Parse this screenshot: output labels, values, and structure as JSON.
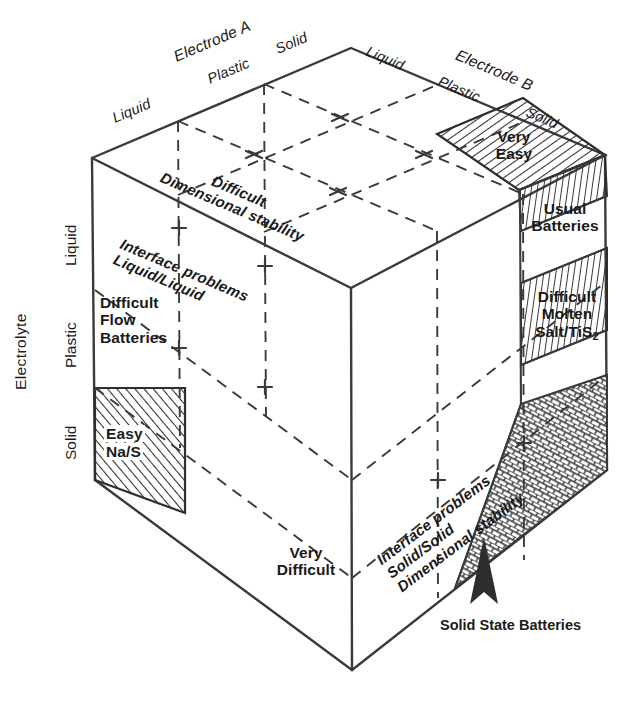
{
  "figure": {
    "type": "isometric-cube-diagram",
    "stroke_color": "#3a3a3a",
    "text_color": "#1a1a1a",
    "background": "#ffffff"
  },
  "axes": {
    "electrode_a": {
      "name": "Electrode A",
      "ticks": [
        "Liquid",
        "Plastic",
        "Solid"
      ]
    },
    "electrode_b": {
      "name": "Electrode B",
      "ticks": [
        "Liquid",
        "Plastic",
        "Solid"
      ]
    },
    "electrolyte": {
      "name": "Electrolyte",
      "ticks": [
        "Liquid",
        "Plastic",
        "Solid"
      ]
    }
  },
  "faces": {
    "top": {
      "label_line1": "Difficult",
      "label_line2": "Dimensional stability"
    },
    "left": {
      "label_line1": "Interface problems",
      "label_line2": "Liquid/Liquid"
    },
    "bottom_right": {
      "label_line1": "Interface problems",
      "label_line2": "Solid/Solid",
      "label_line3": "Dimensional stability"
    }
  },
  "cells": {
    "very_easy": {
      "line1": "Very",
      "line2": "Easy",
      "fill": "hatch-right"
    },
    "usual_batteries": {
      "line1": "Usual",
      "line2": "Batteries",
      "fill": "none"
    },
    "difficult_molten_salt": {
      "line1": "Difficult",
      "line2": "Molten",
      "line3": "Salt/TiS",
      "sub3": "2",
      "fill": "none"
    },
    "difficult_flow_batteries": {
      "line1": "Difficult",
      "line2": "Flow",
      "line3": "Batteries",
      "fill": "none"
    },
    "easy_nas": {
      "line1": "Easy",
      "line2": "Na/S",
      "fill": "hatch-left"
    },
    "very_difficult": {
      "line1": "Very",
      "line2": "Difficult",
      "fill": "none"
    }
  },
  "callouts": {
    "solid_state_batteries": "Solid State Batteries"
  }
}
